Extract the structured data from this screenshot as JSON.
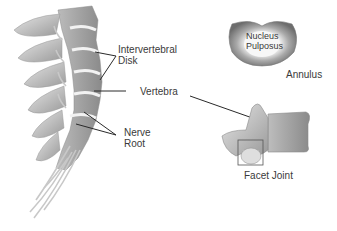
{
  "figure": {
    "type": "anatomical-diagram"
  },
  "labels": {
    "disk_line1": "Intervertebral",
    "disk_line2": "Disk",
    "vertebra": "Vertebra",
    "nerve_line1": "Nerve",
    "nerve_line2": "Root",
    "nucleus_line1": "Nucleus",
    "nucleus_line2": "Pulposus",
    "annulus": "Annulus",
    "facet": "Facet Joint"
  },
  "colors": {
    "bone_light": "#d9d9d9",
    "bone_mid": "#a8a8a8",
    "bone_dark": "#6f6f6f",
    "leader_line": "#2a2a2a",
    "text": "#3a3a3a"
  }
}
